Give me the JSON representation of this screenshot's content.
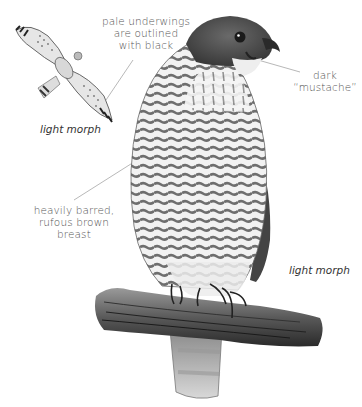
{
  "illustration": {
    "subject": "perched hawk and flying hawk, pencil drawing",
    "colors": {
      "background": "#ffffff",
      "ink_dark": "#222222",
      "ink_mid": "#777777",
      "ink_light": "#bbbbbb",
      "label_text": "#555555",
      "leader_line": "#999999"
    }
  },
  "annotations": {
    "underwings": {
      "lines": [
        "pale underwings",
        "are outlined",
        "with black"
      ]
    },
    "mustache": {
      "lines": [
        "dark",
        "“mustache”"
      ]
    },
    "breast": {
      "lines": [
        "heavily barred,",
        "rufous brown",
        "breast"
      ]
    }
  },
  "captions": {
    "flying_morph": "light morph",
    "perched_morph": "light morph"
  }
}
